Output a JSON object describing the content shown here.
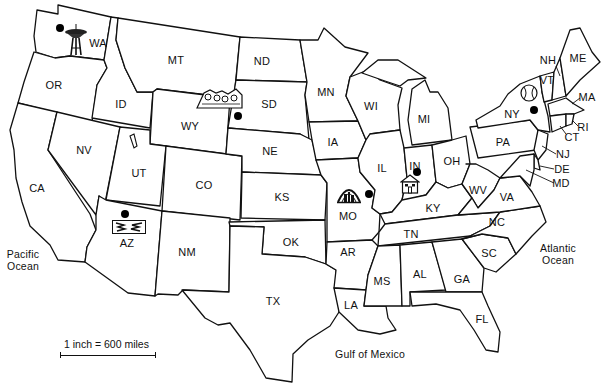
{
  "map": {
    "title": "United States outline map",
    "states": [
      {
        "abbr": "WA",
        "x": 98,
        "y": 43
      },
      {
        "abbr": "OR",
        "x": 54,
        "y": 85
      },
      {
        "abbr": "ID",
        "x": 121,
        "y": 104
      },
      {
        "abbr": "MT",
        "x": 176,
        "y": 60
      },
      {
        "abbr": "WY",
        "x": 190,
        "y": 126
      },
      {
        "abbr": "ND",
        "x": 262,
        "y": 61
      },
      {
        "abbr": "SD",
        "x": 269,
        "y": 104
      },
      {
        "abbr": "NE",
        "x": 270,
        "y": 151
      },
      {
        "abbr": "MN",
        "x": 326,
        "y": 92
      },
      {
        "abbr": "WI",
        "x": 371,
        "y": 106
      },
      {
        "abbr": "MI",
        "x": 424,
        "y": 119
      },
      {
        "abbr": "IA",
        "x": 333,
        "y": 142
      },
      {
        "abbr": "IL",
        "x": 382,
        "y": 168
      },
      {
        "abbr": "IN",
        "x": 415,
        "y": 166
      },
      {
        "abbr": "OH",
        "x": 452,
        "y": 161
      },
      {
        "abbr": "PA",
        "x": 503,
        "y": 142
      },
      {
        "abbr": "NY",
        "x": 512,
        "y": 114
      },
      {
        "abbr": "NV",
        "x": 84,
        "y": 150
      },
      {
        "abbr": "UT",
        "x": 139,
        "y": 173
      },
      {
        "abbr": "CO",
        "x": 204,
        "y": 185
      },
      {
        "abbr": "KS",
        "x": 282,
        "y": 197
      },
      {
        "abbr": "MO",
        "x": 348,
        "y": 216
      },
      {
        "abbr": "KY",
        "x": 433,
        "y": 208
      },
      {
        "abbr": "WV",
        "x": 478,
        "y": 190
      },
      {
        "abbr": "VA",
        "x": 507,
        "y": 197
      },
      {
        "abbr": "CA",
        "x": 37,
        "y": 188
      },
      {
        "abbr": "AZ",
        "x": 127,
        "y": 243
      },
      {
        "abbr": "NM",
        "x": 187,
        "y": 252
      },
      {
        "abbr": "OK",
        "x": 291,
        "y": 242
      },
      {
        "abbr": "AR",
        "x": 348,
        "y": 252
      },
      {
        "abbr": "TN",
        "x": 411,
        "y": 234
      },
      {
        "abbr": "NC",
        "x": 497,
        "y": 222
      },
      {
        "abbr": "SC",
        "x": 489,
        "y": 253
      },
      {
        "abbr": "TX",
        "x": 273,
        "y": 301
      },
      {
        "abbr": "LA",
        "x": 351,
        "y": 305
      },
      {
        "abbr": "MS",
        "x": 382,
        "y": 281
      },
      {
        "abbr": "AL",
        "x": 420,
        "y": 274
      },
      {
        "abbr": "GA",
        "x": 462,
        "y": 279
      },
      {
        "abbr": "FL",
        "x": 482,
        "y": 319
      },
      {
        "abbr": "ME",
        "x": 578,
        "y": 58
      },
      {
        "abbr": "NH",
        "x": 548,
        "y": 60
      },
      {
        "abbr": "VT",
        "x": 547,
        "y": 80
      },
      {
        "abbr": "MA",
        "x": 587,
        "y": 97
      },
      {
        "abbr": "RI",
        "x": 583,
        "y": 127
      },
      {
        "abbr": "CT",
        "x": 572,
        "y": 137
      },
      {
        "abbr": "NJ",
        "x": 563,
        "y": 154
      },
      {
        "abbr": "DE",
        "x": 562,
        "y": 169
      },
      {
        "abbr": "MD",
        "x": 561,
        "y": 183
      }
    ],
    "water_labels": [
      {
        "name": "pacific",
        "line1": "Pacific",
        "line2": "Ocean",
        "x": 23,
        "y": 260
      },
      {
        "name": "atlantic",
        "line1": "Atlantic",
        "line2": "Ocean",
        "x": 558,
        "y": 254
      },
      {
        "name": "gulf",
        "line1": "Gulf of Mexico",
        "line2": "",
        "x": 370,
        "y": 354
      }
    ],
    "scale": {
      "label": "1 inch = 600 miles"
    },
    "landmarks": [
      {
        "name": "space-needle",
        "state": "WA",
        "dot_x": 60,
        "dot_y": 28
      },
      {
        "name": "mount-rushmore",
        "state": "SD",
        "dot_x": 238,
        "dot_y": 116
      },
      {
        "name": "grand-canyon",
        "state": "AZ",
        "dot_x": 125,
        "dot_y": 214
      },
      {
        "name": "gateway-arch",
        "state": "MO",
        "dot_x": 369,
        "dot_y": 194
      },
      {
        "name": "lincoln-home",
        "state": "IN",
        "dot_x": 417,
        "dot_y": 172
      },
      {
        "name": "baseball-hall-of-fame",
        "state": "NY",
        "dot_x": 534,
        "dot_y": 110
      }
    ],
    "colors": {
      "line": "#111111",
      "background": "#ffffff",
      "fill": "#ffffff"
    }
  }
}
